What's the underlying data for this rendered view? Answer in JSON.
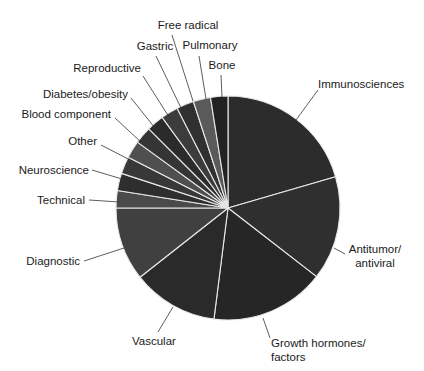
{
  "chart_data": {
    "type": "pie",
    "title": "",
    "start_angle_deg_from_top": 0,
    "direction": "clockwise",
    "unit": "percent (estimated from slice angles)",
    "center": [
      228,
      208
    ],
    "radius": 112,
    "slices": [
      {
        "label": "Immunosciences",
        "value": 20.5,
        "color": "#2c2c2c"
      },
      {
        "label": "Antitumor/\nantiviral",
        "value": 15.0,
        "color": "#2f2f2f"
      },
      {
        "label": "Growth hormones/\nfactors",
        "value": 16.5,
        "color": "#262626"
      },
      {
        "label": "Vascular",
        "value": 12.4,
        "color": "#2a2a2a"
      },
      {
        "label": "Diagnostic",
        "value": 10.6,
        "color": "#404040"
      },
      {
        "label": "Technical",
        "value": 2.5,
        "color": "#4a4a4a"
      },
      {
        "label": "Neuroscience",
        "value": 2.5,
        "color": "#2e2e2e"
      },
      {
        "label": "Other",
        "value": 2.5,
        "color": "#383838"
      },
      {
        "label": "Blood component",
        "value": 2.5,
        "color": "#4f4f4f"
      },
      {
        "label": "Diabetes/obesity",
        "value": 2.5,
        "color": "#353535"
      },
      {
        "label": "Reproductive",
        "value": 2.5,
        "color": "#2b2b2b"
      },
      {
        "label": "Gastric",
        "value": 2.5,
        "color": "#3c3c3c"
      },
      {
        "label": "Free radical",
        "value": 2.5,
        "color": "#303030"
      },
      {
        "label": "Pulmonary",
        "value": 2.5,
        "color": "#5a5a5a"
      },
      {
        "label": "Bone",
        "value": 2.5,
        "color": "#222222"
      }
    ],
    "labels": [
      {
        "text": [
          "Immunosciences"
        ],
        "x": 318,
        "y": 88,
        "anchor": "start",
        "line": [
          [
            318,
            90
          ],
          [
            296,
            120
          ]
        ]
      },
      {
        "text": [
          "Antitumor/",
          "antiviral"
        ],
        "x": 375,
        "y": 253,
        "anchor": "middle",
        "line": [
          [
            345,
            254
          ],
          [
            334,
            248
          ]
        ]
      },
      {
        "text": [
          "Growth hormones/",
          "factors"
        ],
        "x": 271,
        "y": 347,
        "anchor": "start",
        "line": [
          [
            270,
            338
          ],
          [
            263,
            318
          ]
        ]
      },
      {
        "text": [
          "Vascular"
        ],
        "x": 132,
        "y": 345,
        "anchor": "start",
        "line": [
          [
            158,
            332
          ],
          [
            173,
            307
          ]
        ]
      },
      {
        "text": [
          "Diagnostic"
        ],
        "x": 80,
        "y": 265,
        "anchor": "end",
        "line": [
          [
            84,
            261
          ],
          [
            124,
            248
          ]
        ]
      },
      {
        "text": [
          "Technical"
        ],
        "x": 85,
        "y": 204,
        "anchor": "end",
        "line": [
          [
            89,
            200
          ],
          [
            119,
            202
          ]
        ]
      },
      {
        "text": [
          "Neuroscience"
        ],
        "x": 89,
        "y": 174,
        "anchor": "end",
        "line": [
          [
            92,
            170
          ],
          [
            122,
            179
          ]
        ]
      },
      {
        "text": [
          "Other"
        ],
        "x": 97,
        "y": 145,
        "anchor": "end",
        "line": [
          [
            101,
            145
          ],
          [
            130,
            160
          ]
        ]
      },
      {
        "text": [
          "Blood component"
        ],
        "x": 111,
        "y": 118,
        "anchor": "end",
        "line": [
          [
            115,
            118
          ],
          [
            142,
            143
          ]
        ]
      },
      {
        "text": [
          "Diabetes/obesity"
        ],
        "x": 128,
        "y": 98,
        "anchor": "end",
        "line": [
          [
            131,
            98
          ],
          [
            155,
            128
          ]
        ]
      },
      {
        "text": [
          "Reproductive"
        ],
        "x": 141,
        "y": 72,
        "anchor": "end",
        "line": [
          [
            143,
            76
          ],
          [
            169,
            117
          ]
        ]
      },
      {
        "text": [
          "Gastric"
        ],
        "x": 155,
        "y": 50,
        "anchor": "middle",
        "line": [
          [
            156,
            56
          ],
          [
            181,
            108
          ]
        ]
      },
      {
        "text": [
          "Free radical"
        ],
        "x": 188,
        "y": 29,
        "anchor": "middle",
        "line": [
          [
            172,
            35
          ],
          [
            193,
            101
          ]
        ]
      },
      {
        "text": [
          "Pulmonary"
        ],
        "x": 210,
        "y": 49,
        "anchor": "middle",
        "line": [
          [
            199,
            56
          ],
          [
            206,
            99
          ]
        ]
      },
      {
        "text": [
          "Bone"
        ],
        "x": 222,
        "y": 69,
        "anchor": "middle",
        "line": [
          [
            221,
            75
          ],
          [
            222,
            97
          ]
        ]
      }
    ],
    "legend": "none (direct labels with leader lines)",
    "grid": false
  }
}
